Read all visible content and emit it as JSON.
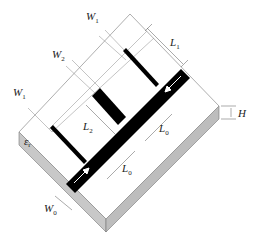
{
  "diagram": {
    "colors": {
      "background": "#ffffff",
      "substrate_top": "#ffffff",
      "substrate_side": "#c8c8c8",
      "conductor": "#000000",
      "dimension_line": "#555555",
      "arrow": "#ffffff"
    },
    "labels": {
      "w1_top": {
        "main": "W",
        "sub": "1"
      },
      "w2": {
        "main": "W",
        "sub": "2"
      },
      "w1_left": {
        "main": "W",
        "sub": "1"
      },
      "l1": {
        "main": "L",
        "sub": "1"
      },
      "l2": {
        "main": "L",
        "sub": "2"
      },
      "l0_upper": {
        "main": "L",
        "sub": "0"
      },
      "l0_lower": {
        "main": "L",
        "sub": "0"
      },
      "w0": {
        "main": "W",
        "sub": "0"
      },
      "h": {
        "main": "H",
        "sub": ""
      },
      "er": {
        "main": "ε",
        "sub": "r"
      }
    },
    "components": [
      "substrate",
      "main feed line",
      "upper stub (width W1, length L1)",
      "middle stub (width W2, length L2)",
      "lower stub (width W1)",
      "input arrow",
      "output arrow"
    ]
  }
}
